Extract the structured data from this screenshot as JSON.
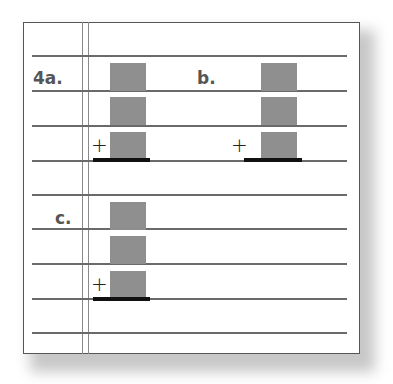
{
  "worksheet": {
    "problems": [
      {
        "label": "4a.",
        "operator": "+",
        "addend_boxes": 3
      },
      {
        "label": "b.",
        "operator": "+",
        "addend_boxes": 3
      },
      {
        "label": "c.",
        "operator": "+",
        "addend_boxes": 3
      }
    ]
  },
  "colors": {
    "box": "#8f8f8f",
    "rule_line": "#6a6a6a",
    "border": "#555555",
    "sum_line": "#111111"
  }
}
